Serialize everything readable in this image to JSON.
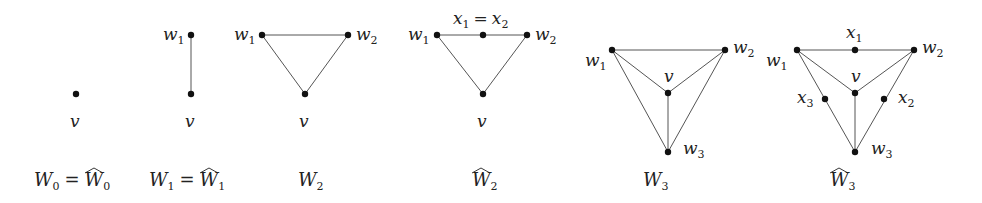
{
  "graphs": [
    {
      "id": "W0",
      "caption": {
        "main": "W",
        "sub": "0",
        "eq": " = ",
        "hat_main": "W",
        "hat_sub": "0"
      },
      "nodes": [
        {
          "label": "v",
          "x": 76,
          "y": 94
        }
      ],
      "edges": []
    },
    {
      "id": "W1",
      "caption": {
        "main": "W",
        "sub": "1",
        "eq": " = ",
        "hat_main": "W",
        "hat_sub": "1"
      },
      "nodes": [
        {
          "label": "w1",
          "x": 191,
          "y": 35
        },
        {
          "label": "v",
          "x": 191,
          "y": 94
        }
      ],
      "edges": [
        [
          "w1",
          "v"
        ]
      ]
    },
    {
      "id": "W2",
      "caption": {
        "main": "W",
        "sub": "2"
      },
      "nodes": [
        {
          "label": "w1",
          "x": 262,
          "y": 35
        },
        {
          "label": "w2",
          "x": 348,
          "y": 35
        },
        {
          "label": "v",
          "x": 305,
          "y": 94
        }
      ],
      "edges": [
        [
          "w1",
          "w2"
        ],
        [
          "w1",
          "v"
        ],
        [
          "w2",
          "v"
        ]
      ]
    },
    {
      "id": "W2hat",
      "caption": {
        "hat_main": "W",
        "hat_sub": "2"
      },
      "nodes": [
        {
          "label": "w1",
          "x": 437,
          "y": 35
        },
        {
          "label": "x1 = x2",
          "x": 483,
          "y": 35
        },
        {
          "label": "w2",
          "x": 527,
          "y": 35
        },
        {
          "label": "v",
          "x": 483,
          "y": 94
        }
      ],
      "edges": [
        [
          "w1",
          "x1"
        ],
        [
          "x1",
          "w2"
        ],
        [
          "w1",
          "v"
        ],
        [
          "w2",
          "v"
        ]
      ]
    },
    {
      "id": "W3",
      "caption": {
        "main": "W",
        "sub": "3"
      },
      "nodes": [
        {
          "label": "w1",
          "x": 612,
          "y": 50
        },
        {
          "label": "w2",
          "x": 725,
          "y": 50
        },
        {
          "label": "v",
          "x": 668,
          "y": 93
        },
        {
          "label": "w3",
          "x": 668,
          "y": 152
        }
      ],
      "edges": [
        [
          "w1",
          "w2"
        ],
        [
          "w1",
          "v"
        ],
        [
          "w2",
          "v"
        ],
        [
          "v",
          "w3"
        ],
        [
          "w1",
          "w3"
        ],
        [
          "w2",
          "w3"
        ]
      ]
    },
    {
      "id": "W3hat",
      "caption": {
        "hat_main": "W",
        "hat_sub": "3"
      },
      "nodes": [
        {
          "label": "w1",
          "x": 797,
          "y": 50
        },
        {
          "label": "x1",
          "x": 855,
          "y": 50
        },
        {
          "label": "w2",
          "x": 914,
          "y": 50
        },
        {
          "label": "v",
          "x": 855,
          "y": 93
        },
        {
          "label": "x3",
          "x": 825,
          "y": 99
        },
        {
          "label": "x2",
          "x": 884,
          "y": 99
        },
        {
          "label": "w3",
          "x": 855,
          "y": 152
        }
      ],
      "edges": [
        [
          "w1",
          "x1"
        ],
        [
          "x1",
          "w2"
        ],
        [
          "w1",
          "v"
        ],
        [
          "w2",
          "v"
        ],
        [
          "v",
          "w3"
        ],
        [
          "w1",
          "x3"
        ],
        [
          "x3",
          "w3"
        ],
        [
          "w2",
          "x2"
        ],
        [
          "x2",
          "w3"
        ]
      ]
    }
  ],
  "labels": {
    "v": "v",
    "w": "w",
    "x": "x",
    "W": "W",
    "eq": "=",
    "s0": "0",
    "s1": "1",
    "s2": "2",
    "s3": "3"
  }
}
